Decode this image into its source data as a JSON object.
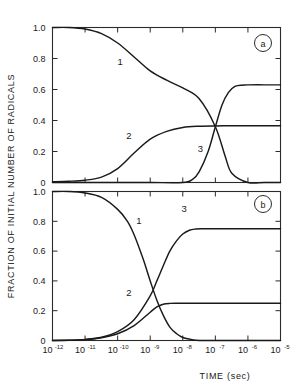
{
  "figure": {
    "background_color": "#ffffff",
    "line_color": "#1a1a1a",
    "axis_color": "#2b2b2b"
  },
  "axes": {
    "y_title": "FRACTION OF INITIAL NUMBER OF RADICALS",
    "x_title": "TIME  (sec)"
  },
  "panels": [
    {
      "id": "a",
      "label": "a",
      "y_ticklabels": [
        "1.0",
        "0.8",
        "0.6",
        "0.4",
        "0.2",
        "0"
      ],
      "curve_labels": [
        "1",
        "2",
        "3"
      ]
    },
    {
      "id": "b",
      "label": "b",
      "y_ticklabels": [
        "1.0",
        "0.8",
        "0.6",
        "0.4",
        "0.2",
        "0"
      ],
      "curve_labels": [
        "1",
        "2",
        "3"
      ]
    }
  ],
  "x_ticklabels": [
    {
      "base": "10",
      "exp": "-12"
    },
    {
      "base": "10",
      "exp": "-11"
    },
    {
      "base": "10",
      "exp": "-10"
    },
    {
      "base": "10",
      "exp": "-9"
    },
    {
      "base": "10",
      "exp": "-8"
    },
    {
      "base": "10",
      "exp": "-7"
    },
    {
      "base": "10",
      "exp": "-6"
    },
    {
      "base": "10",
      "exp": "-5"
    }
  ],
  "chart_data": {
    "type": "line",
    "title": "",
    "xlabel": "TIME  (sec)",
    "ylabel": "FRACTION OF INITIAL NUMBER OF RADICALS",
    "x_scale": "log",
    "xlim": [
      1e-12,
      1e-05
    ],
    "ylim": [
      0,
      1.0
    ],
    "x_ticks": [
      1e-12,
      1e-11,
      1e-10,
      1e-09,
      1e-08,
      1e-07,
      1e-06,
      1e-05
    ],
    "x_ticklabels": [
      "10^-12",
      "10^-11",
      "10^-10",
      "10^-9",
      "10^-8",
      "10^-7",
      "10^-6",
      "10^-5"
    ],
    "y_ticks": [
      0,
      0.2,
      0.4,
      0.6,
      0.8,
      1.0
    ],
    "y_ticklabels": [
      "0",
      "0.2",
      "0.4",
      "0.6",
      "0.8",
      "1.0"
    ],
    "grid": false,
    "legend": "inline-curve-numbers",
    "panels": [
      {
        "panel": "a",
        "annotation": "a",
        "series": [
          {
            "name": "1",
            "label_position": {
              "x": 1.2e-10,
              "y": 0.76
            },
            "x": [
              1e-12,
              3.2e-12,
              1e-11,
              3.2e-11,
              1e-10,
              3.2e-10,
              1e-09,
              3.2e-09,
              1e-08,
              3.2e-08,
              1e-07,
              2e-07,
              3.2e-07,
              1e-06,
              3.2e-06,
              1e-05
            ],
            "y": [
              1.0,
              1.0,
              0.99,
              0.96,
              0.9,
              0.81,
              0.72,
              0.66,
              0.61,
              0.54,
              0.36,
              0.17,
              0.06,
              0.0,
              0.0,
              0.0
            ]
          },
          {
            "name": "2",
            "label_position": {
              "x": 2.2e-10,
              "y": 0.28
            },
            "x": [
              1e-12,
              3.2e-12,
              1e-11,
              3.2e-11,
              1e-10,
              3.2e-10,
              1e-09,
              3.2e-09,
              1e-08,
              3.2e-08,
              1e-07,
              3.2e-07,
              1e-06,
              3.2e-06,
              1e-05
            ],
            "y": [
              0.005,
              0.008,
              0.015,
              0.035,
              0.09,
              0.19,
              0.28,
              0.33,
              0.355,
              0.363,
              0.365,
              0.366,
              0.366,
              0.366,
              0.366
            ]
          },
          {
            "name": "3",
            "label_position": {
              "x": 3.5e-08,
              "y": 0.2
            },
            "x": [
              1e-12,
              1e-10,
              1e-09,
              1e-08,
              2e-08,
              3.2e-08,
              6e-08,
              1e-07,
              1.6e-07,
              2.5e-07,
              4e-07,
              7e-07,
              1e-06,
              3.2e-06,
              1e-05
            ],
            "y": [
              0.0,
              0.0,
              0.0,
              0.0,
              0.02,
              0.07,
              0.2,
              0.36,
              0.5,
              0.58,
              0.62,
              0.628,
              0.63,
              0.63,
              0.63
            ]
          }
        ]
      },
      {
        "panel": "b",
        "annotation": "b",
        "series": [
          {
            "name": "1",
            "label_position": {
              "x": 4.5e-10,
              "y": 0.78
            },
            "x": [
              1e-12,
              3.2e-12,
              1e-11,
              3.2e-11,
              1e-10,
              2e-10,
              3.2e-10,
              6e-10,
              1e-09,
              1.6e-09,
              2.5e-09,
              4e-09,
              6.5e-09,
              1e-08,
              2e-08,
              3.2e-08,
              1e-07,
              1e-06,
              1e-05
            ],
            "y": [
              1.0,
              1.0,
              0.99,
              0.96,
              0.88,
              0.8,
              0.71,
              0.55,
              0.4,
              0.27,
              0.17,
              0.09,
              0.045,
              0.02,
              0.005,
              0.0,
              0.0,
              0.0,
              0.0
            ]
          },
          {
            "name": "2",
            "label_position": {
              "x": 2.2e-10,
              "y": 0.3
            },
            "x": [
              1e-12,
              3.2e-12,
              1e-11,
              3.2e-11,
              1e-10,
              3.2e-10,
              1e-09,
              1.6e-09,
              2.5e-09,
              4e-09,
              6.5e-09,
              1e-08,
              3.2e-08,
              1e-07,
              1e-06,
              1e-05
            ],
            "y": [
              0.0,
              0.002,
              0.006,
              0.018,
              0.045,
              0.1,
              0.19,
              0.225,
              0.243,
              0.249,
              0.25,
              0.25,
              0.25,
              0.25,
              0.25,
              0.25
            ]
          },
          {
            "name": "3",
            "label_position": {
              "x": 1.1e-08,
              "y": 0.86
            },
            "x": [
              1e-12,
              3.2e-12,
              1e-11,
              3.2e-11,
              1e-10,
              3.2e-10,
              1e-09,
              1.6e-09,
              2.5e-09,
              4e-09,
              6.5e-09,
              1e-08,
              1.6e-08,
              2.5e-08,
              4e-08,
              6.5e-08,
              1e-07,
              1e-06,
              1e-05
            ],
            "y": [
              0.0,
              0.002,
              0.007,
              0.022,
              0.06,
              0.14,
              0.3,
              0.4,
              0.5,
              0.6,
              0.67,
              0.715,
              0.74,
              0.748,
              0.75,
              0.75,
              0.75,
              0.75,
              0.75
            ]
          }
        ]
      }
    ]
  }
}
